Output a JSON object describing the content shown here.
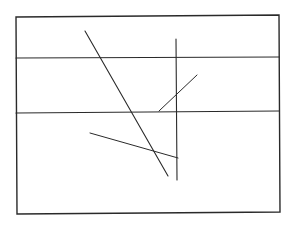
{
  "diagram": {
    "stroke_color": "#2a2a2a",
    "background": "#ffffff",
    "frame": {
      "points": [
        [
          16,
          17
        ],
        [
          279,
          15
        ],
        [
          280,
          212
        ],
        [
          17,
          214
        ]
      ],
      "stroke_width": 1.4
    },
    "lines": [
      {
        "id": "horizontal-upper",
        "x1": 16,
        "y1": 58,
        "x2": 279,
        "y2": 57,
        "stroke_width": 1.2
      },
      {
        "id": "horizontal-lower",
        "x1": 16,
        "y1": 113,
        "x2": 279,
        "y2": 111,
        "stroke_width": 1.2
      },
      {
        "id": "long-diagonal",
        "x1": 85,
        "y1": 31,
        "x2": 168,
        "y2": 176,
        "stroke_width": 1.1
      },
      {
        "id": "vertical",
        "x1": 176,
        "y1": 39,
        "x2": 177,
        "y2": 180,
        "stroke_width": 1.1
      },
      {
        "id": "short-diagonal",
        "x1": 159,
        "y1": 111,
        "x2": 197,
        "y2": 75,
        "stroke_width": 1.0
      },
      {
        "id": "lower-diagonal",
        "x1": 90,
        "y1": 133,
        "x2": 178,
        "y2": 158,
        "stroke_width": 1.0
      }
    ]
  }
}
